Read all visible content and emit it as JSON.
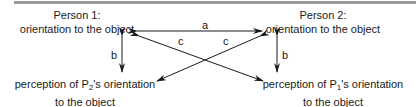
{
  "diagram": {
    "person1": {
      "title": "Person 1:",
      "orientation": "orientation to the object",
      "perception_prefix": "perception of P",
      "perception_sub": "2",
      "perception_suffix": "'s orientation",
      "perception_line2": "to the object"
    },
    "person2": {
      "title": "Person 2:",
      "orientation": "orientation to the object",
      "perception_prefix": "perception of P",
      "perception_sub": "1",
      "perception_suffix": "'s orientation",
      "perception_line2": "to the object"
    },
    "edges": {
      "a": "a",
      "b_left": "b",
      "b_right": "b",
      "c_left": "c",
      "c_right": "c"
    },
    "colors": {
      "line": "#1a1a1a",
      "top_rule": "#9a9a9a"
    }
  }
}
